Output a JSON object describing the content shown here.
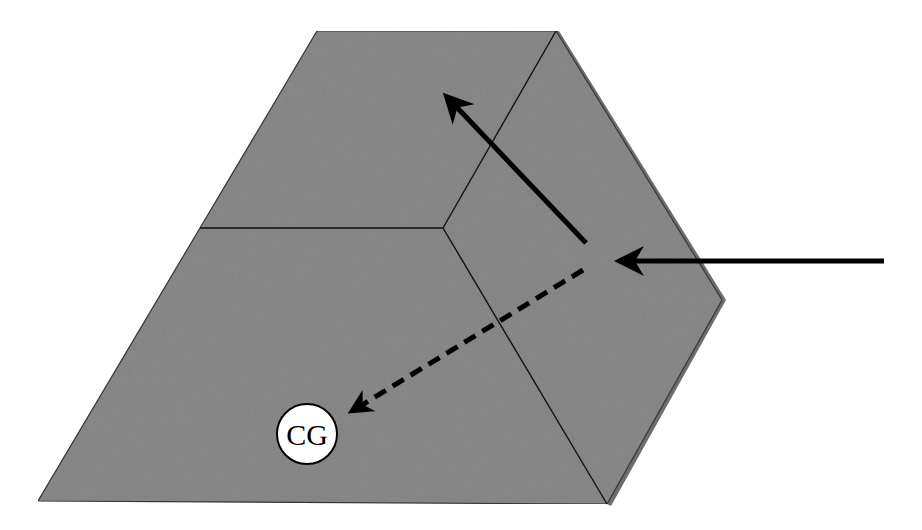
{
  "diagram": {
    "colors": {
      "background": "#ffffff",
      "block_fill": "#8c8c8c",
      "block_edge": "#1a1a1a",
      "arrow": "#000000",
      "cg_fill": "#ffffff"
    },
    "shape": {
      "outline": [
        [
          317,
          31
        ],
        [
          556,
          31
        ],
        [
          722,
          300
        ],
        [
          607,
          504
        ],
        [
          38,
          501
        ],
        [
          200,
          228
        ]
      ],
      "edges": [
        {
          "name": "top-face-divider",
          "from": [
            200,
            228
          ],
          "to": [
            443,
            228
          ]
        },
        {
          "name": "ridge-upper",
          "from": [
            556,
            31
          ],
          "to": [
            443,
            228
          ]
        },
        {
          "name": "ridge-lower",
          "from": [
            443,
            228
          ],
          "to": [
            607,
            504
          ]
        }
      ]
    },
    "arrows": [
      {
        "name": "incoming-force-arrow",
        "style": "solid",
        "from": [
          884,
          261
        ],
        "to": [
          615,
          261
        ]
      },
      {
        "name": "deflected-force-arrow",
        "style": "solid",
        "from": [
          586,
          243
        ],
        "to": [
          443,
          93
        ]
      },
      {
        "name": "cg-direction-arrow",
        "style": "dashed",
        "from": [
          583,
          270
        ],
        "to": [
          348,
          413
        ]
      }
    ],
    "cg": {
      "label": "CG",
      "center": [
        307,
        434
      ],
      "radius": 30
    }
  }
}
